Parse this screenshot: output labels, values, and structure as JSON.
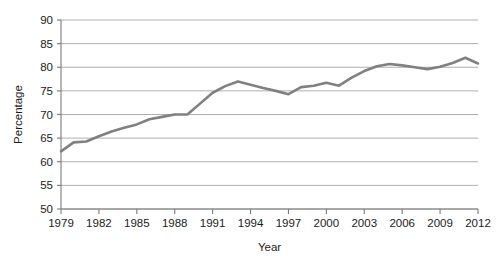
{
  "chart_data": {
    "type": "line",
    "title": "",
    "xlabel": "Year",
    "ylabel": "Percentage",
    "xlim": [
      1979,
      2012
    ],
    "ylim": [
      50,
      90
    ],
    "grid": true,
    "legend": "none",
    "line_color": "#808080",
    "grid_color": "#9a9a9a",
    "axis_color": "#7a7a7a",
    "y_ticks": [
      50,
      55,
      60,
      65,
      70,
      75,
      80,
      85,
      90
    ],
    "y_tick_labels": [
      "50",
      "55",
      "60",
      "65",
      "70",
      "75",
      "80",
      "85",
      "90"
    ],
    "x_ticks": [
      1979,
      1982,
      1985,
      1988,
      1991,
      1994,
      1997,
      2000,
      2003,
      2006,
      2009,
      2012
    ],
    "x_tick_labels": [
      "1979",
      "1982",
      "1985",
      "1988",
      "1991",
      "1994",
      "1997",
      "2000",
      "2003",
      "2006",
      "2009",
      "2012"
    ],
    "x": [
      1979,
      1980,
      1981,
      1982,
      1983,
      1984,
      1985,
      1986,
      1987,
      1988,
      1989,
      1990,
      1991,
      1992,
      1993,
      1994,
      1995,
      1996,
      1997,
      1998,
      1999,
      2000,
      2001,
      2002,
      2003,
      2004,
      2005,
      2006,
      2007,
      2008,
      2009,
      2010,
      2011,
      2012
    ],
    "values": [
      62.2,
      64.1,
      64.3,
      65.4,
      66.4,
      67.2,
      67.9,
      69.0,
      69.5,
      70.0,
      70.0,
      72.3,
      74.6,
      76.0,
      77.0,
      76.3,
      75.6,
      75.0,
      74.3,
      75.8,
      76.1,
      76.7,
      76.1,
      77.8,
      79.2,
      80.2,
      80.7,
      80.4,
      80.0,
      79.6,
      80.1,
      80.9,
      82.0,
      80.8
    ]
  }
}
